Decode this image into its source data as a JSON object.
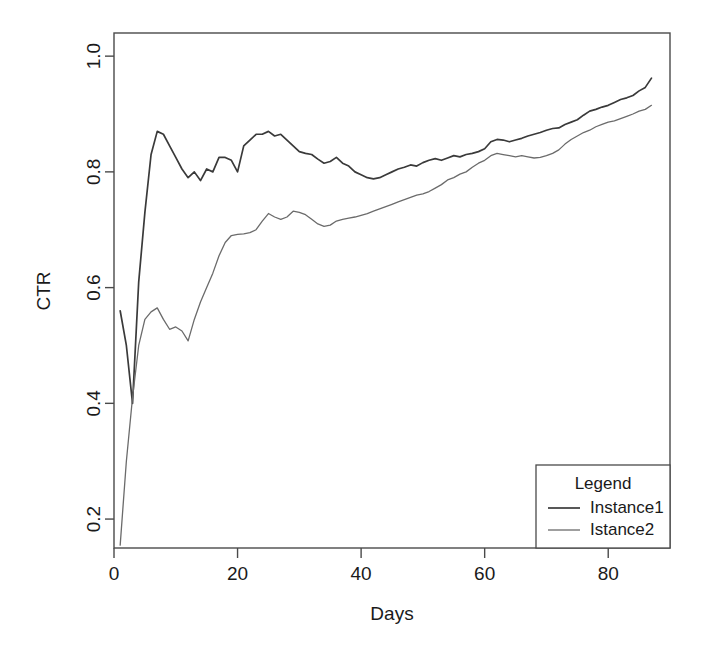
{
  "chart_data": {
    "type": "line",
    "title": "",
    "xlabel": "Days",
    "ylabel": "CTR",
    "xlim": [
      0,
      90
    ],
    "ylim": [
      0.15,
      1.04
    ],
    "grid": false,
    "legend_position": "bottom-right",
    "legend_title": "Legend",
    "xticks": [
      "0",
      "20",
      "40",
      "60",
      "80"
    ],
    "xtick_values": [
      0,
      20,
      40,
      60,
      80
    ],
    "yticks": [
      "0.2",
      "0.4",
      "0.6",
      "0.8",
      "1.0"
    ],
    "ytick_values": [
      0.2,
      0.4,
      0.6,
      0.8,
      1.0
    ],
    "series": [
      {
        "name": "Instance1",
        "color": "#3a3a3a",
        "x": [
          1,
          2,
          3,
          4,
          5,
          6,
          7,
          8,
          9,
          10,
          11,
          12,
          13,
          14,
          15,
          16,
          17,
          18,
          19,
          20,
          21,
          22,
          23,
          24,
          25,
          26,
          27,
          28,
          29,
          30,
          31,
          32,
          33,
          34,
          35,
          36,
          37,
          38,
          39,
          40,
          41,
          42,
          43,
          44,
          45,
          46,
          47,
          48,
          49,
          50,
          51,
          52,
          53,
          54,
          55,
          56,
          57,
          58,
          59,
          60,
          61,
          62,
          63,
          64,
          65,
          66,
          67,
          68,
          69,
          70,
          71,
          72,
          73,
          74,
          75,
          76,
          77,
          78,
          79,
          80,
          81,
          82,
          83,
          84,
          85,
          86,
          87
        ],
        "values": [
          0.56,
          0.5,
          0.4,
          0.61,
          0.73,
          0.83,
          0.87,
          0.865,
          0.845,
          0.825,
          0.805,
          0.79,
          0.8,
          0.785,
          0.805,
          0.8,
          0.825,
          0.825,
          0.82,
          0.8,
          0.845,
          0.855,
          0.865,
          0.865,
          0.87,
          0.862,
          0.865,
          0.855,
          0.845,
          0.835,
          0.832,
          0.83,
          0.822,
          0.815,
          0.818,
          0.825,
          0.815,
          0.81,
          0.8,
          0.795,
          0.79,
          0.788,
          0.79,
          0.795,
          0.8,
          0.805,
          0.808,
          0.812,
          0.81,
          0.816,
          0.82,
          0.823,
          0.82,
          0.824,
          0.828,
          0.826,
          0.83,
          0.832,
          0.835,
          0.84,
          0.852,
          0.856,
          0.855,
          0.852,
          0.855,
          0.858,
          0.862,
          0.865,
          0.868,
          0.872,
          0.875,
          0.876,
          0.882,
          0.886,
          0.89,
          0.898,
          0.905,
          0.908,
          0.912,
          0.915,
          0.92,
          0.925,
          0.928,
          0.932,
          0.94,
          0.946,
          0.962
        ]
      },
      {
        "name": "Istance2",
        "color": "#6b6b6b",
        "x": [
          1,
          2,
          3,
          4,
          5,
          6,
          7,
          8,
          9,
          10,
          11,
          12,
          13,
          14,
          15,
          16,
          17,
          18,
          19,
          20,
          21,
          22,
          23,
          24,
          25,
          26,
          27,
          28,
          29,
          30,
          31,
          32,
          33,
          34,
          35,
          36,
          37,
          38,
          39,
          40,
          41,
          42,
          43,
          44,
          45,
          46,
          47,
          48,
          49,
          50,
          51,
          52,
          53,
          54,
          55,
          56,
          57,
          58,
          59,
          60,
          61,
          62,
          63,
          64,
          65,
          66,
          67,
          68,
          69,
          70,
          71,
          72,
          73,
          74,
          75,
          76,
          77,
          78,
          79,
          80,
          81,
          82,
          83,
          84,
          85,
          86,
          87
        ],
        "values": [
          0.155,
          0.3,
          0.41,
          0.5,
          0.545,
          0.558,
          0.565,
          0.545,
          0.528,
          0.532,
          0.525,
          0.508,
          0.545,
          0.575,
          0.6,
          0.625,
          0.655,
          0.678,
          0.69,
          0.692,
          0.693,
          0.695,
          0.7,
          0.715,
          0.728,
          0.722,
          0.718,
          0.722,
          0.732,
          0.73,
          0.726,
          0.718,
          0.71,
          0.706,
          0.708,
          0.715,
          0.718,
          0.72,
          0.722,
          0.725,
          0.728,
          0.732,
          0.736,
          0.74,
          0.744,
          0.748,
          0.752,
          0.756,
          0.76,
          0.762,
          0.766,
          0.772,
          0.778,
          0.786,
          0.79,
          0.796,
          0.8,
          0.808,
          0.815,
          0.82,
          0.828,
          0.832,
          0.83,
          0.828,
          0.826,
          0.828,
          0.826,
          0.824,
          0.825,
          0.828,
          0.832,
          0.838,
          0.848,
          0.856,
          0.862,
          0.868,
          0.872,
          0.878,
          0.882,
          0.886,
          0.888,
          0.892,
          0.896,
          0.9,
          0.905,
          0.908,
          0.915
        ]
      }
    ]
  },
  "plot": {
    "frame_color": "#4a4a4a",
    "background": "#ffffff"
  }
}
